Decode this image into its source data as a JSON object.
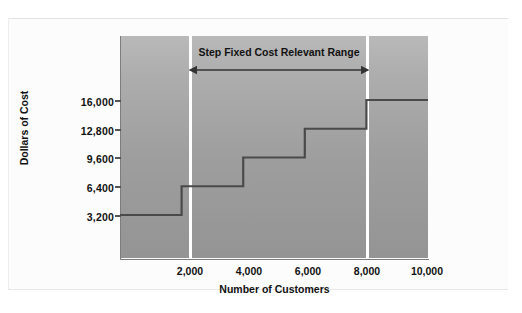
{
  "chart_data": {
    "type": "line",
    "title": "",
    "subtitle": "",
    "xlabel": "Number of Customers",
    "ylabel": "Dollars of Cost",
    "x_ticks": [
      "2,000",
      "4,000",
      "6,000",
      "8,000",
      "10,000"
    ],
    "x_tick_values": [
      2000,
      4000,
      6000,
      8000,
      10000
    ],
    "y_ticks": [
      "3,200",
      "6,400",
      "9,600",
      "12,800",
      "16,000"
    ],
    "y_tick_values": [
      3200,
      6400,
      9600,
      12800,
      16000
    ],
    "xlim": [
      0,
      10000
    ],
    "ylim": [
      0,
      17600
    ],
    "grid": false,
    "legend": null,
    "series": [
      {
        "name": "Step Fixed Cost",
        "style": "step",
        "steps": [
          {
            "x_start": 0,
            "x_end": 2000,
            "value": 3200
          },
          {
            "x_start": 2000,
            "x_end": 4000,
            "value": 6400
          },
          {
            "x_start": 4000,
            "x_end": 6000,
            "value": 9600
          },
          {
            "x_start": 6000,
            "x_end": 8000,
            "value": 12800
          },
          {
            "x_start": 8000,
            "x_end": 10000,
            "value": 16000
          }
        ]
      }
    ],
    "annotations": [
      {
        "text": "Step Fixed Cost Relevant Range",
        "arrow": "double-headed",
        "x_start": 2000,
        "x_end": 8000
      }
    ],
    "region_dividers": [
      2000,
      8000
    ],
    "colors": {
      "panel_light": "#b9b9b9",
      "panel_dark": "#949494",
      "step_line": "#4a4a4a",
      "divider": "#ffffff",
      "axis": "#7d7d7d",
      "text": "#111111",
      "background": "#fcfcfc"
    }
  },
  "axes": {
    "y_title": "Dollars of Cost",
    "x_title": "Number of Customers",
    "y_labels": [
      "16,000",
      "12,800",
      "9,600",
      "6,400",
      "3,200"
    ],
    "x_labels": [
      "2,000",
      "4,000",
      "6,000",
      "8,000",
      "10,000"
    ]
  },
  "annotation": {
    "relevant_range_label": "Step Fixed Cost Relevant Range"
  }
}
